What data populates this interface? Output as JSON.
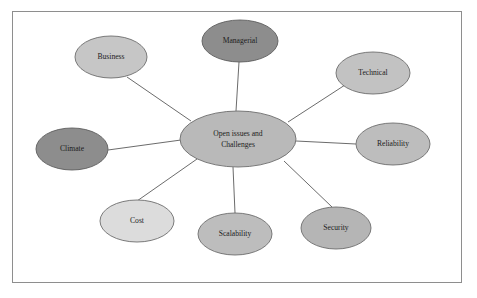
{
  "figure": {
    "kind": "concept-map",
    "border_color": "#8e8e8e",
    "background": "#ffffff",
    "edge_color": "#5a5a5a"
  },
  "center": {
    "id": "center",
    "line1": "Open issues and",
    "line2": "Challenges",
    "fill": "#b9b9b9",
    "stroke": "#6d6d6d",
    "cx": 238,
    "cy": 139,
    "rx": 58,
    "ry": 28,
    "font_size": 7.6
  },
  "nodes": [
    {
      "id": "business",
      "label": "Business",
      "fill": "#c6c6c6",
      "stroke": "#6d6d6d",
      "cx": 111,
      "cy": 57,
      "rx": 36,
      "ry": 21,
      "font_size": 7.6
    },
    {
      "id": "managerial",
      "label": "Managerial",
      "fill": "#8d8d8d",
      "stroke": "#5e5e5e",
      "cx": 240,
      "cy": 41,
      "rx": 38,
      "ry": 21,
      "font_size": 7.6
    },
    {
      "id": "technical",
      "label": "Technical",
      "fill": "#c2c2c2",
      "stroke": "#6d6d6d",
      "cx": 373,
      "cy": 73,
      "rx": 37,
      "ry": 21,
      "font_size": 7.6
    },
    {
      "id": "reliability",
      "label": "Reliability",
      "fill": "#bdbdbd",
      "stroke": "#6d6d6d",
      "cx": 393,
      "cy": 144,
      "rx": 37,
      "ry": 21,
      "font_size": 7.6
    },
    {
      "id": "climate",
      "label": "Climate",
      "fill": "#8d8d8d",
      "stroke": "#5e5e5e",
      "cx": 72,
      "cy": 149,
      "rx": 36,
      "ry": 21,
      "font_size": 7.6
    },
    {
      "id": "cost",
      "label": "Cost",
      "fill": "#dcdcdc",
      "stroke": "#6d6d6d",
      "cx": 137,
      "cy": 221,
      "rx": 37,
      "ry": 21,
      "font_size": 7.6
    },
    {
      "id": "scalability",
      "label": "Scalability",
      "fill": "#bdbdbd",
      "stroke": "#6d6d6d",
      "cx": 235,
      "cy": 234,
      "rx": 37,
      "ry": 21,
      "font_size": 7.6
    },
    {
      "id": "security",
      "label": "Security",
      "fill": "#b5b5b5",
      "stroke": "#6d6d6d",
      "cx": 336,
      "cy": 228,
      "rx": 35,
      "ry": 21,
      "font_size": 7.6
    }
  ],
  "edges": [
    {
      "id": "edge-center-business",
      "from": "center",
      "to": "business",
      "x1": 191,
      "y1": 121,
      "x2": 127,
      "y2": 77
    },
    {
      "id": "edge-center-managerial",
      "from": "center",
      "to": "managerial",
      "x1": 236,
      "y1": 111,
      "x2": 239,
      "y2": 62
    },
    {
      "id": "edge-center-technical",
      "from": "center",
      "to": "technical",
      "x1": 288,
      "y1": 122,
      "x2": 345,
      "y2": 85
    },
    {
      "id": "edge-center-reliability",
      "from": "center",
      "to": "reliability",
      "x1": 296,
      "y1": 141,
      "x2": 356,
      "y2": 144
    },
    {
      "id": "edge-center-climate",
      "from": "center",
      "to": "climate",
      "x1": 181,
      "y1": 140,
      "x2": 108,
      "y2": 150
    },
    {
      "id": "edge-center-cost",
      "from": "center",
      "to": "cost",
      "x1": 197,
      "y1": 159,
      "x2": 137,
      "y2": 201
    },
    {
      "id": "edge-center-scalability",
      "from": "center",
      "to": "scalability",
      "x1": 233,
      "y1": 167,
      "x2": 235,
      "y2": 213
    },
    {
      "id": "edge-center-security",
      "from": "center",
      "to": "security",
      "x1": 284,
      "y1": 161,
      "x2": 332,
      "y2": 207
    }
  ]
}
